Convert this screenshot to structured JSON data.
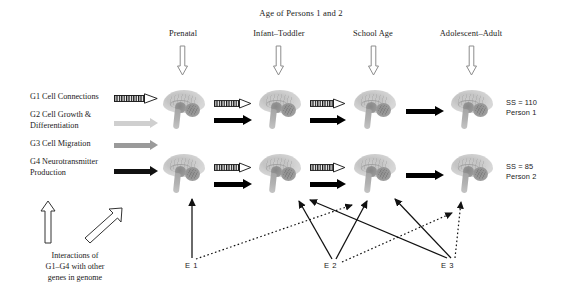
{
  "figure": {
    "title": "Age of Persons 1 and 2",
    "stages": [
      {
        "label": "Prenatal",
        "x": 183
      },
      {
        "label": "Infant–Toddler",
        "x": 279
      },
      {
        "label": "School Age",
        "x": 373
      },
      {
        "label": "Adolescent–Adult",
        "x": 471
      }
    ],
    "gene_legend": [
      {
        "id": "G1",
        "label": "G1 Cell Connections",
        "arrow": "hatched-arrow",
        "color": "#111111"
      },
      {
        "id": "G2",
        "label": "G2 Cell Growth &\nDifferentiation",
        "arrow": "solid-arrow",
        "color": "#cfcfcf"
      },
      {
        "id": "G3",
        "label": "G3 Cell Migration",
        "arrow": "solid-arrow",
        "color": "#9a9a9a"
      },
      {
        "id": "G4",
        "label": "G4 Neurotransmitter\nProduction",
        "arrow": "solid-arrow",
        "color": "#111111"
      }
    ],
    "gene_legend_lines": {
      "g1": "G1 Cell Connections",
      "g2a": "G2 Cell Growth &",
      "g2b": "Differentiation",
      "g3": "G3 Cell Migration",
      "g4a": "G4 Neurotransmitter",
      "g4b": "Production"
    },
    "interactions_note": {
      "line1": "Interactions of",
      "line2": "G1–G4 with other",
      "line3": "genes in genome"
    },
    "persons": [
      {
        "id": "person-1",
        "score_label": "SS = 110",
        "name_label": "Person 1",
        "row_y": 88
      },
      {
        "id": "person-2",
        "score_label": "SS = 85",
        "name_label": "Person 2",
        "row_y": 152
      }
    ],
    "environment_factors": [
      {
        "id": "E1",
        "label": "E 1",
        "x": 191,
        "y": 266
      },
      {
        "id": "E2",
        "label": "E 2",
        "x": 330,
        "y": 266
      },
      {
        "id": "E3",
        "label": "E 3",
        "x": 447,
        "y": 266
      }
    ],
    "brain_columns_x": [
      161,
      257,
      352,
      449
    ],
    "colors": {
      "ink": "#1a1a1a",
      "arrow_black": "#000000",
      "arrow_gray_light": "#cfcfcf",
      "arrow_gray_mid": "#9a9a9a",
      "stage_arrow_outline": "#8c8c8c",
      "background": "#ffffff"
    }
  }
}
